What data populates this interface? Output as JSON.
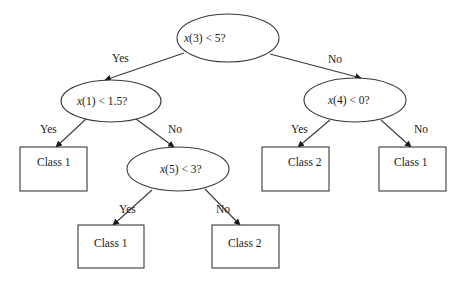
{
  "diagram": {
    "type": "decision-tree",
    "nodes": {
      "root": {
        "var": "x",
        "label": "(3) < 5?",
        "full_label": "x(3) < 5?",
        "shape": "ellipse"
      },
      "n_left": {
        "var": "x",
        "label": "(1) < 1.5?",
        "full_label": "x(1) < 1.5?",
        "shape": "ellipse"
      },
      "n_right": {
        "var": "x",
        "label": "(4) < 0?",
        "full_label": "x(4) < 0?",
        "shape": "ellipse"
      },
      "n_left_no": {
        "var": "x",
        "label": "(5) < 3?",
        "full_label": "x(5) < 3?",
        "shape": "ellipse"
      },
      "leaf_left_yes": {
        "label": "Class 1",
        "shape": "rect"
      },
      "leaf_x5_yes": {
        "label": "Class 1",
        "shape": "rect"
      },
      "leaf_x5_no": {
        "label": "Class 2",
        "shape": "rect"
      },
      "leaf_right_yes": {
        "label": "Class 2",
        "shape": "rect"
      },
      "leaf_right_no": {
        "label": "Class 1",
        "shape": "rect"
      }
    },
    "edges": {
      "root_yes": {
        "from": "root",
        "to": "n_left",
        "label": "Yes"
      },
      "root_no": {
        "from": "root",
        "to": "n_right",
        "label": "No"
      },
      "left_yes": {
        "from": "n_left",
        "to": "leaf_left_yes",
        "label": "Yes"
      },
      "left_no": {
        "from": "n_left",
        "to": "n_left_no",
        "label": "No"
      },
      "x5_yes": {
        "from": "n_left_no",
        "to": "leaf_x5_yes",
        "label": "Yes"
      },
      "x5_no": {
        "from": "n_left_no",
        "to": "leaf_x5_no",
        "label": "No"
      },
      "right_yes": {
        "from": "n_right",
        "to": "leaf_right_yes",
        "label": "Yes"
      },
      "right_no": {
        "from": "n_right",
        "to": "leaf_right_no",
        "label": "No"
      }
    },
    "colors": {
      "stroke": "#3a3a3a",
      "text": "#1a1a1a",
      "background": "#ffffff"
    }
  }
}
